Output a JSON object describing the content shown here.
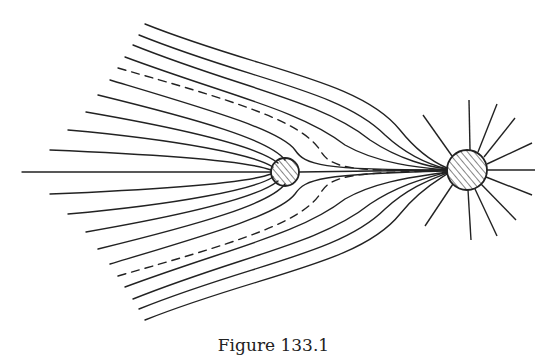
{
  "figure": {
    "caption": "Figure 133.1",
    "small_charge": {
      "cx": 285,
      "cy": 172,
      "r": 14
    },
    "large_charge": {
      "cx": 467,
      "cy": 170,
      "r": 20
    },
    "stroke_color": "#222222"
  }
}
